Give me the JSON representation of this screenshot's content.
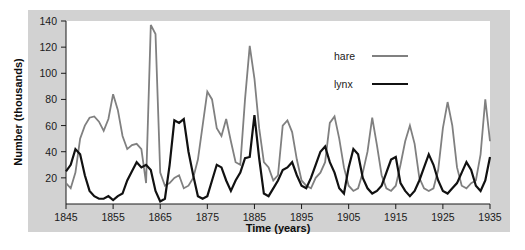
{
  "chart_data": {
    "type": "line",
    "title": "",
    "xlabel": "Time (years)",
    "ylabel": "Number (thousands)",
    "xlim": [
      1845,
      1935
    ],
    "ylim": [
      0,
      140
    ],
    "xticks": [
      1845,
      1855,
      1865,
      1875,
      1885,
      1895,
      1905,
      1915,
      1925,
      1935
    ],
    "yticks": [
      20,
      40,
      60,
      80,
      100,
      120,
      140
    ],
    "grid": false,
    "legend_position": "top-right",
    "x": [
      1845,
      1846,
      1847,
      1848,
      1849,
      1850,
      1851,
      1852,
      1853,
      1854,
      1855,
      1856,
      1857,
      1858,
      1859,
      1860,
      1861,
      1862,
      1863,
      1864,
      1865,
      1866,
      1867,
      1868,
      1869,
      1870,
      1871,
      1872,
      1873,
      1874,
      1875,
      1876,
      1877,
      1878,
      1879,
      1880,
      1881,
      1882,
      1883,
      1884,
      1885,
      1886,
      1887,
      1888,
      1889,
      1890,
      1891,
      1892,
      1893,
      1894,
      1895,
      1896,
      1897,
      1898,
      1899,
      1900,
      1901,
      1902,
      1903,
      1904,
      1905,
      1906,
      1907,
      1908,
      1909,
      1910,
      1911,
      1912,
      1913,
      1914,
      1915,
      1916,
      1917,
      1918,
      1919,
      1920,
      1921,
      1922,
      1923,
      1924,
      1925,
      1926,
      1927,
      1928,
      1929,
      1930,
      1931,
      1932,
      1933,
      1934,
      1935
    ],
    "series": [
      {
        "name": "hare",
        "color": "#808080",
        "linewidth": 1.8,
        "values": [
          16,
          12,
          24,
          50,
          60,
          66,
          67,
          63,
          56,
          65,
          84,
          72,
          52,
          42,
          45,
          46,
          42,
          16,
          137,
          130,
          24,
          14,
          16,
          20,
          22,
          12,
          14,
          20,
          34,
          60,
          86,
          80,
          58,
          52,
          65,
          48,
          32,
          30,
          80,
          121,
          96,
          58,
          32,
          28,
          18,
          22,
          60,
          64,
          55,
          34,
          18,
          14,
          12,
          20,
          24,
          32,
          62,
          67,
          50,
          28,
          14,
          10,
          12,
          24,
          40,
          66,
          45,
          22,
          12,
          10,
          14,
          30,
          48,
          60,
          46,
          20,
          12,
          10,
          12,
          26,
          58,
          78,
          60,
          28,
          14,
          12,
          16,
          18,
          38,
          80,
          48
        ]
      },
      {
        "name": "lynx",
        "color": "#111111",
        "linewidth": 2.2,
        "values": [
          25,
          30,
          42,
          38,
          22,
          10,
          6,
          4,
          4,
          6,
          3,
          6,
          8,
          18,
          25,
          32,
          28,
          30,
          26,
          10,
          2,
          4,
          30,
          64,
          62,
          65,
          40,
          22,
          6,
          4,
          6,
          18,
          30,
          28,
          18,
          10,
          18,
          24,
          35,
          36,
          68,
          35,
          8,
          6,
          12,
          18,
          26,
          28,
          32,
          22,
          14,
          12,
          20,
          30,
          40,
          44,
          32,
          24,
          12,
          8,
          28,
          42,
          38,
          20,
          12,
          8,
          10,
          14,
          24,
          34,
          36,
          16,
          10,
          6,
          10,
          18,
          28,
          38,
          30,
          18,
          10,
          8,
          12,
          16,
          24,
          32,
          26,
          14,
          10,
          18,
          36
        ]
      }
    ]
  },
  "legend": {
    "entries": [
      {
        "label": "hare",
        "color": "#808080"
      },
      {
        "label": "lynx",
        "color": "#111111"
      }
    ]
  },
  "axes": {
    "x_title": "Time (years)",
    "y_title": "Number (thousands)"
  }
}
